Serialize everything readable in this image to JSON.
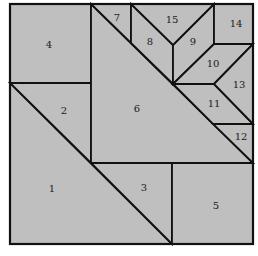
{
  "diagram": {
    "type": "tangram-like dissection of a square into 15 numbered polygons",
    "background_color": "#ffffff",
    "piece_fill": "#bfbfbf",
    "line_color": "#111111",
    "pieces": [
      {
        "id": "1",
        "label": "1",
        "points": "10,83 172,244 10,244",
        "label_pos": [
          52,
          189
        ]
      },
      {
        "id": "2",
        "label": "2",
        "points": "10,83 91,83 91,163",
        "label_pos": [
          64,
          111
        ]
      },
      {
        "id": "3",
        "label": "3",
        "points": "91,163 172,163 172,244",
        "label_pos": [
          144,
          188
        ]
      },
      {
        "id": "4",
        "label": "4",
        "points": "10,4 91,4 91,83 10,83",
        "label_pos": [
          49,
          45
        ]
      },
      {
        "id": "5",
        "label": "5",
        "points": "172,163 253,163 253,244 172,244",
        "label_pos": [
          216,
          206
        ]
      },
      {
        "id": "6",
        "label": "6",
        "points": "91,4 253,163 91,163",
        "label_pos": [
          137,
          109
        ]
      },
      {
        "id": "7",
        "label": "7",
        "points": "91,4 131,4 131,43",
        "label_pos": [
          117,
          18
        ]
      },
      {
        "id": "8",
        "label": "8",
        "points": "131,4 173,45 173,84 131,43",
        "label_pos": [
          150,
          42
        ]
      },
      {
        "id": "9",
        "label": "9",
        "points": "173,45 214,4 214,44 173,84",
        "label_pos": [
          193,
          42
        ]
      },
      {
        "id": "10",
        "label": "10",
        "points": "173,84 214,44 253,44 214,84",
        "label_pos": [
          213,
          64
        ]
      },
      {
        "id": "11",
        "label": "11",
        "points": "173,84 214,84 253,124 213,124",
        "label_pos": [
          214,
          104
        ]
      },
      {
        "id": "12",
        "label": "12",
        "points": "213,124 253,124 253,163",
        "label_pos": [
          241,
          137
        ]
      },
      {
        "id": "13",
        "label": "13",
        "points": "214,84 253,44 253,124",
        "label_pos": [
          239,
          85
        ]
      },
      {
        "id": "14",
        "label": "14",
        "points": "214,4 253,4 253,44 214,44",
        "label_pos": [
          236,
          24
        ]
      },
      {
        "id": "15",
        "label": "15",
        "points": "131,4 214,4 173,45",
        "label_pos": [
          172,
          20
        ]
      }
    ]
  }
}
